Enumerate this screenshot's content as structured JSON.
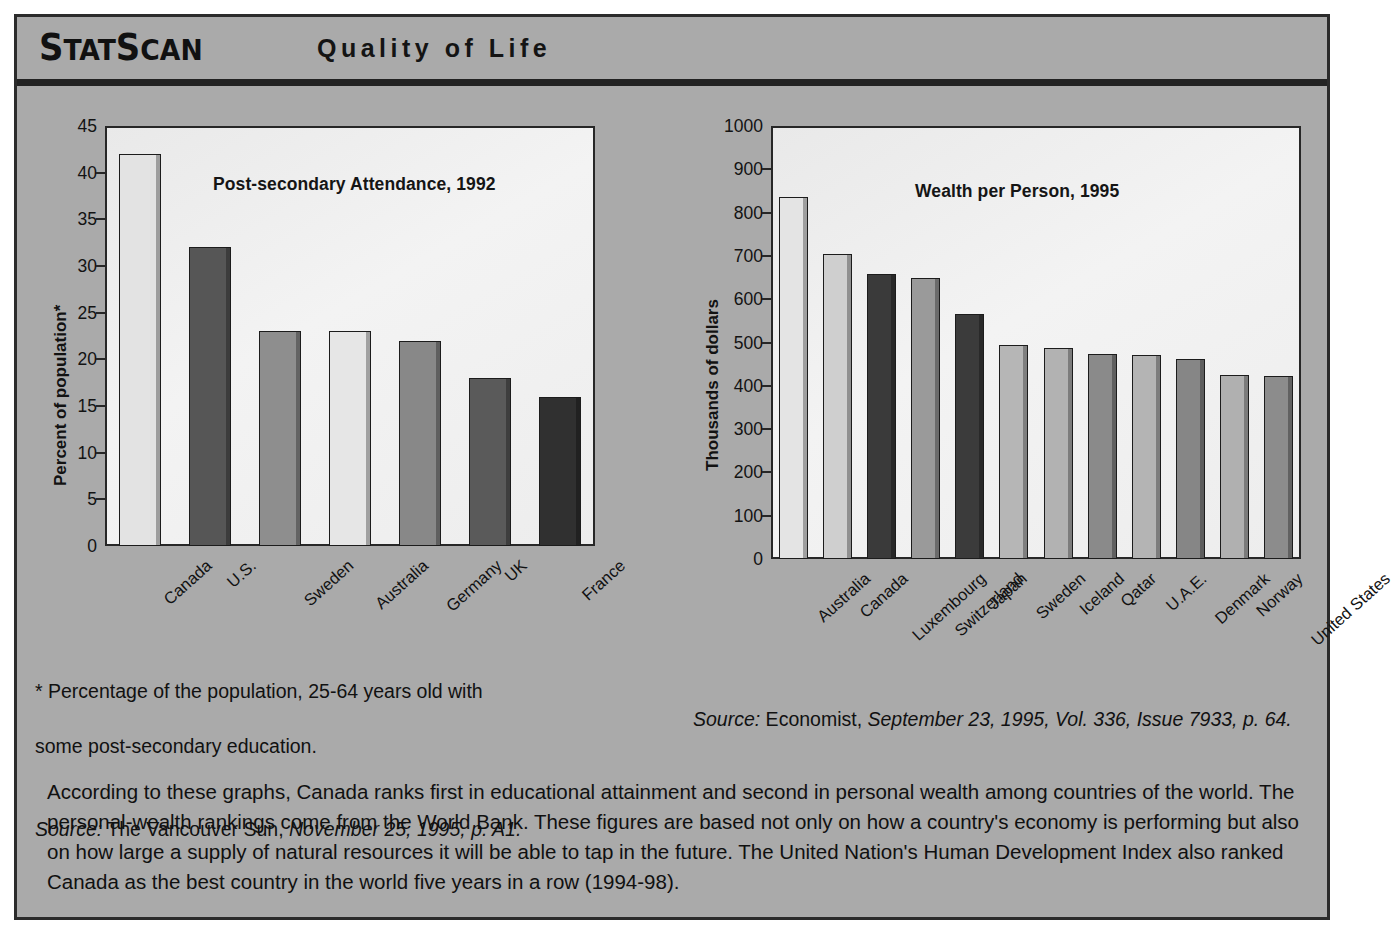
{
  "header": {
    "brand_part1": "S",
    "brand": "StatScan",
    "title": "Quality of Life"
  },
  "chart_data": [
    {
      "type": "bar",
      "title": "Post-secondary Attendance, 1992",
      "ylabel": "Percent of population*",
      "xlabel": "",
      "categories": [
        "Canada",
        "U.S.",
        "Sweden",
        "Australia",
        "Germany",
        "UK",
        "France"
      ],
      "values": [
        42,
        32,
        23,
        23,
        22,
        18,
        16
      ],
      "ylim": [
        0,
        45
      ],
      "yticks": [
        0,
        5,
        10,
        15,
        20,
        25,
        30,
        35,
        40,
        45
      ],
      "grid": false,
      "legend": "none",
      "bar_colors": [
        "#e3e3e3",
        "#565656",
        "#8e8e8e",
        "#e6e6e6",
        "#888888",
        "#5a5a5a",
        "#303030"
      ]
    },
    {
      "type": "bar",
      "title": "Wealth per Person, 1995",
      "ylabel": "Thousands of dollars",
      "xlabel": "",
      "categories": [
        "Australia",
        "Canada",
        "Luxembourg",
        "Switzerland",
        "Japan",
        "Sweden",
        "Iceland",
        "Qatar",
        "U.A.E.",
        "Denmark",
        "Norway",
        "United States"
      ],
      "values": [
        835,
        705,
        658,
        648,
        565,
        495,
        487,
        473,
        470,
        462,
        425,
        422
      ],
      "ylim": [
        0,
        1000
      ],
      "yticks": [
        0,
        100,
        200,
        300,
        400,
        500,
        600,
        700,
        800,
        900,
        1000
      ],
      "grid": false,
      "legend": "none",
      "bar_colors": [
        "#e4e4e4",
        "#cfcfcf",
        "#3a3a3a",
        "#9a9a9a",
        "#3b3b3b",
        "#b6b6b6",
        "#b2b2b2",
        "#8a8a8a",
        "#b4b4b4",
        "#868686",
        "#b0b0b0",
        "#8c8c8c"
      ]
    }
  ],
  "notes": {
    "left_footnote_line1": "* Percentage of the population, 25-64 years old with",
    "left_footnote_line2": "some post-secondary education.",
    "left_source_label": "Source:",
    "left_source_plain": " The Vancouver Sun,",
    "left_source_italic": " November 25, 1995, p. A1.",
    "right_source_label": "Source:",
    "right_source_plain": " Economist,",
    "right_source_italic": " September 23, 1995, Vol. 336, Issue 7933, p. 64."
  },
  "body": {
    "paragraph": "According to these graphs, Canada ranks first in educational attainment and second in personal wealth among countries of the world. The personal-wealth rankings come from the World Bank. These figures are based not only on how a country's economy is performing but also on how large a supply of natural resources it will be able to tap in the future. The United Nation's Human Development Index also ranked Canada as the best country in the world five years in a row (1994-98)."
  },
  "colors": {
    "panel_background": "#aaaaaa",
    "border": "#2b2b2b",
    "plot_background": "#efefef",
    "text": "#111111"
  }
}
